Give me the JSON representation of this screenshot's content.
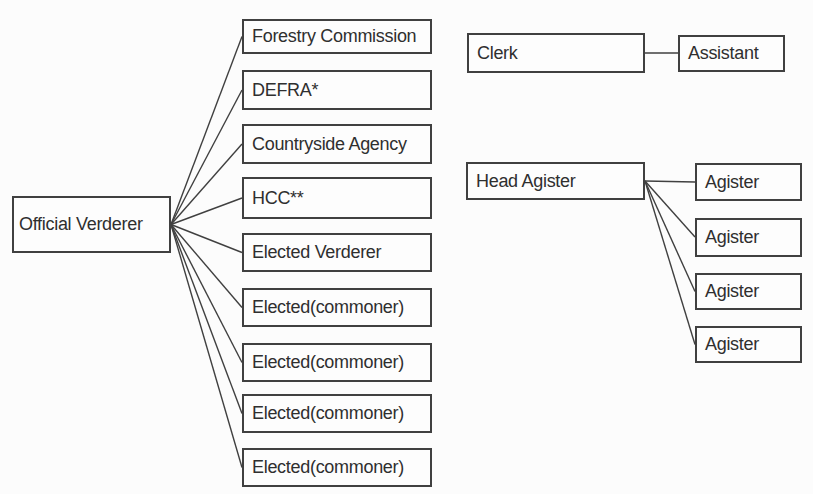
{
  "nodes": {
    "official_verderer": "Official Verderer",
    "court_members": [
      "Forestry Commission",
      "DEFRA*",
      "Countryside Agency",
      "HCC**",
      "Elected Verderer",
      "Elected(commoner)",
      "Elected(commoner)",
      "Elected(commoner)",
      "Elected(commoner)"
    ],
    "clerk": "Clerk",
    "clerk_assistant": "Assistant",
    "head_agister": "Head Agister",
    "agisters": [
      "Agister",
      "Agister",
      "Agister",
      "Agister"
    ]
  },
  "colors": {
    "line": "#404040",
    "box_border": "#404040",
    "text": "#2f2f2f",
    "background": "#fcfcfc"
  }
}
